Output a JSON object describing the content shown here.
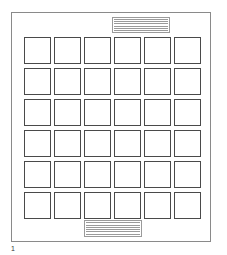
{
  "page": {
    "page_number": "1",
    "top_text_block": {
      "lines": 6
    },
    "bottom_text_block": {
      "lines": 6
    },
    "grid": {
      "rows": 6,
      "columns": 6
    }
  }
}
